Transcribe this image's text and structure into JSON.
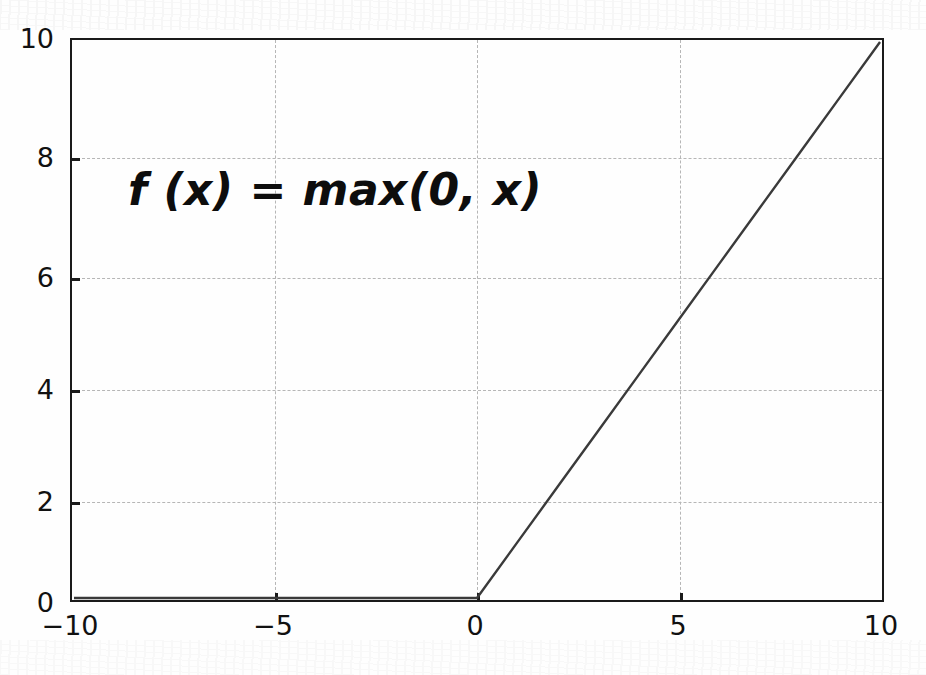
{
  "chart_data": {
    "type": "line",
    "title": "",
    "annotation": "f (x) =  max(0, x)",
    "xlabel": "",
    "ylabel": "",
    "xlim": [
      -10,
      10
    ],
    "ylim": [
      0,
      10
    ],
    "xticks": [
      -10,
      -5,
      0,
      5,
      10
    ],
    "xtick_labels": [
      "−10",
      "−5",
      "0",
      "5",
      "10"
    ],
    "yticks": [
      0,
      2,
      4,
      6,
      8,
      10
    ],
    "ytick_labels": [
      "0",
      "2",
      "4",
      "6",
      "8",
      "10"
    ],
    "grid": true,
    "grid_style": "dashed",
    "grid_color": "#b6b6b6",
    "line_color": "#3a3a3a",
    "line_width": 2.4,
    "axis_color": "#1a1a1a",
    "background_color": "#fefefe",
    "legend": null,
    "series": [
      {
        "name": "relu",
        "x": [
          -10,
          -9,
          -8,
          -7,
          -6,
          -5,
          -4,
          -3,
          -2,
          -1,
          0,
          1,
          2,
          3,
          4,
          5,
          6,
          7,
          8,
          9,
          10
        ],
        "values": [
          0,
          0,
          0,
          0,
          0,
          0,
          0,
          0,
          0,
          0,
          0,
          1,
          2,
          3,
          4,
          5,
          6,
          7,
          8,
          9,
          10
        ]
      }
    ]
  },
  "axes": {
    "y_labels": [
      "10",
      "8",
      "6",
      "4",
      "2",
      "0"
    ],
    "x_labels": [
      "−10",
      "−5",
      "0",
      "5",
      "10"
    ]
  },
  "annotation": {
    "formula": "f (x) =  max(0, x)"
  }
}
